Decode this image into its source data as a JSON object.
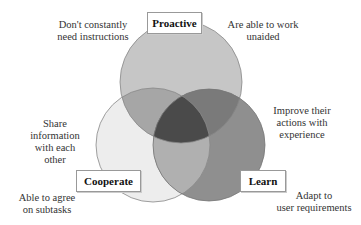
{
  "diagram": {
    "type": "venn",
    "sets": [
      {
        "id": "proactive",
        "label": "Proactive",
        "fill": "#c6c6c6"
      },
      {
        "id": "cooperate",
        "label": "Cooperate",
        "fill": "#ededed"
      },
      {
        "id": "learn",
        "label": "Learn",
        "fill": "#8f8f8f"
      }
    ],
    "overlap_colors": {
      "proactive_cooperate": "#a6a6a6",
      "proactive_learn": "#7a7a7a",
      "cooperate_learn": "#b0b0b0",
      "all_three": "#4a4a4a"
    },
    "annotations": {
      "proactive_left": "Don't constantly need instructions",
      "proactive_right": "Are able to work unaided",
      "cooperate_share": "Share information with each other",
      "cooperate_agree": "Able to agree on subtasks",
      "learn_improve": "Improve their actions with experience",
      "learn_adapt": "Adapt to user requirements"
    }
  },
  "text": {
    "proactive_left_l1": "Don't constantly",
    "proactive_left_l2": "need instructions",
    "proactive_right_l1": "Are able to work",
    "proactive_right_l2": "unaided",
    "share_l1": "Share",
    "share_l2": "information",
    "share_l3": "with each",
    "share_l4": "other",
    "agree_l1": "Able to agree",
    "agree_l2": "on subtasks",
    "improve_l1": "Improve their",
    "improve_l2": "actions with",
    "improve_l3": "experience",
    "adapt_l1": "Adapt to",
    "adapt_l2": "user requirements",
    "proactive": "Proactive",
    "cooperate": "Cooperate",
    "learn": "Learn"
  }
}
